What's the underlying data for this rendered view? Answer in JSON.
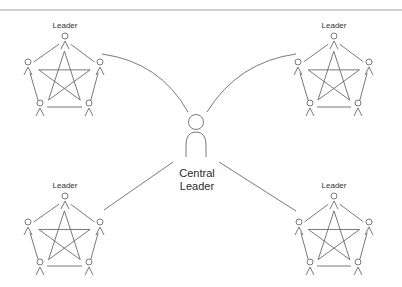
{
  "diagram": {
    "title_rule": true,
    "central": {
      "label_line1": "Central",
      "label_line2": "Leader",
      "icon": "person-icon"
    },
    "groups": [
      {
        "id": "top-left",
        "leader_label": "Leader",
        "members": 5,
        "connection": "curve"
      },
      {
        "id": "top-right",
        "leader_label": "Leader",
        "members": 5,
        "connection": "curve"
      },
      {
        "id": "bottom-left",
        "leader_label": "Leader",
        "members": 5,
        "connection": "line"
      },
      {
        "id": "bottom-right",
        "leader_label": "Leader",
        "members": 5,
        "connection": "line"
      }
    ],
    "colors": {
      "stroke": "#6a6a6a",
      "text": "#333333",
      "background": "#ffffff"
    }
  }
}
